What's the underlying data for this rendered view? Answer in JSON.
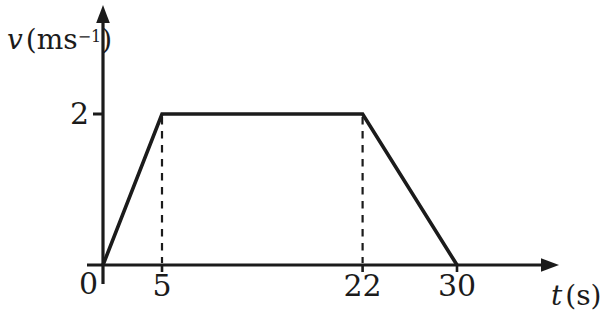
{
  "chart_data": {
    "type": "line",
    "title": "",
    "xlabel": "t (s)",
    "ylabel": "v (ms⁻¹)",
    "xlabel_parts": {
      "var": "t",
      "unit": "(s)"
    },
    "ylabel_parts": {
      "var": "v",
      "unit_open": "(ms",
      "unit_sup": "−1",
      "unit_close": ")"
    },
    "x": [
      0,
      5,
      22,
      30
    ],
    "y": [
      0,
      2,
      2,
      0
    ],
    "x_ticks": [
      5,
      22,
      30
    ],
    "x_tick_labels": [
      "5",
      "22",
      "30"
    ],
    "y_ticks": [
      2
    ],
    "y_tick_labels": [
      "2"
    ],
    "origin_label": "0",
    "guides": [
      {
        "x": 5,
        "y": 2
      },
      {
        "x": 22,
        "y": 2
      }
    ],
    "xlim": [
      0,
      38
    ],
    "ylim": [
      0,
      3.4
    ],
    "grid": false,
    "legend": null,
    "line_color": "#1b1b1b",
    "background_color": "#ffffff"
  }
}
